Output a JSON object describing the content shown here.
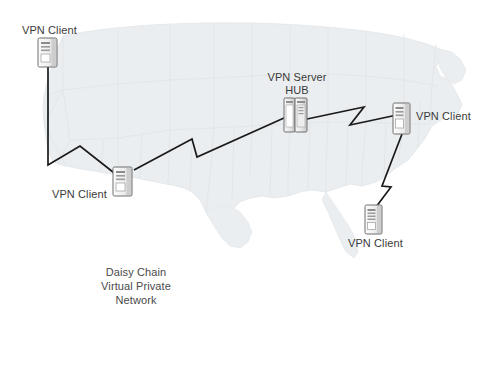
{
  "diagram": {
    "title_caption": "Daisy Chain\nVirtual Private\nNetwork",
    "background": {
      "name": "united-states-map",
      "fill": "#ebeef0",
      "border": "#dfe4e6"
    },
    "colors": {
      "link_line": "#1a1a1a",
      "label_text": "#3a3a3a",
      "caption_text": "#4a4a4a",
      "device_body": "#f2f2f2",
      "device_outline": "#6e6e6e",
      "device_shade": "#c9c9c9",
      "page_background": "#ffffff"
    },
    "nodes": [
      {
        "id": "client-northwest",
        "label": "VPN Client",
        "icon": "server-tower-icon",
        "x": 45,
        "y": 38,
        "label_x": 22,
        "label_y": 24,
        "label_align": "left"
      },
      {
        "id": "client-southwest",
        "label": "VPN Client",
        "icon": "server-tower-icon",
        "x": 120,
        "y": 167,
        "label_x": 52,
        "label_y": 188,
        "label_align": "left"
      },
      {
        "id": "server-hub",
        "label": "VPN Server\nHUB",
        "icon": "server-rack-double-icon",
        "x": 291,
        "y": 106,
        "label_x": 266,
        "label_y": 71,
        "label_align": "center"
      },
      {
        "id": "client-northeast",
        "label": "VPN Client",
        "icon": "server-tower-icon",
        "x": 399,
        "y": 110,
        "label_x": 416,
        "label_y": 110,
        "label_align": "left"
      },
      {
        "id": "client-southeast",
        "label": "VPN Client",
        "icon": "server-tower-icon",
        "x": 372,
        "y": 208,
        "label_x": 348,
        "label_y": 237,
        "label_align": "left"
      }
    ],
    "links": [
      {
        "id": "link-nw-to-sw",
        "from": "client-northwest",
        "to": "client-southwest",
        "points": "48,66 48,165 80,146 118,176"
      },
      {
        "id": "link-sw-to-hub",
        "from": "client-southwest",
        "to": "server-hub",
        "points": "134,170 192,139 197,157 284,118"
      },
      {
        "id": "link-hub-to-ne",
        "from": "server-hub",
        "to": "client-northeast",
        "points": "307,119 364,107 350,125 397,115"
      },
      {
        "id": "link-ne-to-se",
        "from": "client-northeast",
        "to": "client-southeast",
        "points": "402,134 382,186 391,187 373,211"
      }
    ],
    "caption": {
      "x": 94,
      "y": 265,
      "width": 84
    }
  }
}
